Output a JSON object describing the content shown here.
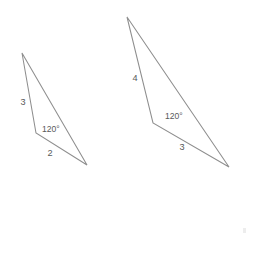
{
  "figure": {
    "background_color": "#ffffff",
    "line_color": "#8e8e8e",
    "text_color": "#59595b"
  },
  "triangles": [
    {
      "id": "small-triangle",
      "name": "left-triangle",
      "vertices": {
        "apex": {
          "x": 22,
          "y": 53
        },
        "vertex": {
          "x": 36,
          "y": 133
        },
        "base": {
          "x": 87,
          "y": 165
        }
      },
      "labels": {
        "side_a": {
          "text": "3",
          "x": 23,
          "y": 103
        },
        "angle": {
          "text": "120°",
          "x": 42,
          "y": 130
        },
        "side_b": {
          "text": "2",
          "x": 50,
          "y": 154
        }
      }
    },
    {
      "id": "large-triangle",
      "name": "right-triangle",
      "vertices": {
        "apex": {
          "x": 127,
          "y": 17
        },
        "vertex": {
          "x": 153,
          "y": 123
        },
        "base": {
          "x": 229,
          "y": 167
        }
      },
      "labels": {
        "side_a": {
          "text": "4",
          "x": 135,
          "y": 79
        },
        "angle": {
          "text": "120°",
          "x": 165,
          "y": 117
        },
        "side_b": {
          "text": "3",
          "x": 182,
          "y": 148
        }
      }
    }
  ],
  "artifact": {
    "name": "page-speck",
    "x": 243,
    "y": 228,
    "width": 3,
    "height": 5
  }
}
